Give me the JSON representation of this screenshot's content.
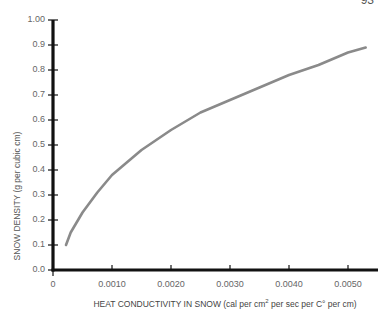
{
  "page": {
    "number": "93"
  },
  "chart_data": {
    "type": "line",
    "title": "",
    "xlabel": "HEAT CONDUCTIVITY IN SNOW (cal per cm² per sec per C° per cm)",
    "xlabel_parts": {
      "pre": "HEAT CONDUCTIVITY IN SNOW (cal per cm",
      "sup": "2",
      "post": " per sec  per C° per cm)"
    },
    "ylabel": "SNOW DENSITY (g per cubic cm)",
    "xlim": [
      0,
      0.0055
    ],
    "ylim": [
      0,
      1.0
    ],
    "x_ticks": [
      "0",
      "0.0010",
      "0.0020",
      "0.0030",
      "0.0040",
      "0.0050"
    ],
    "x_tick_values": [
      0,
      0.001,
      0.002,
      0.003,
      0.004,
      0.005
    ],
    "y_ticks": [
      "0.0",
      "0.1",
      "0.2",
      "0.3",
      "0.4",
      "0.5",
      "0.6",
      "0.7",
      "0.8",
      "0.9",
      "1.00"
    ],
    "y_tick_values": [
      0,
      0.1,
      0.2,
      0.3,
      0.4,
      0.5,
      0.6,
      0.7,
      0.8,
      0.9,
      1.0
    ],
    "grid": false,
    "legend": null,
    "series": [
      {
        "name": "Snow density vs heat conductivity",
        "color": "#8a8a8a",
        "x": [
          0.00022,
          0.0003,
          0.0005,
          0.00075,
          0.001,
          0.0015,
          0.002,
          0.0025,
          0.003,
          0.0035,
          0.004,
          0.0045,
          0.005,
          0.0053
        ],
        "y": [
          0.1,
          0.15,
          0.23,
          0.31,
          0.38,
          0.48,
          0.56,
          0.63,
          0.68,
          0.73,
          0.78,
          0.82,
          0.87,
          0.89
        ]
      }
    ]
  },
  "colors": {
    "axis": "#111111",
    "curve": "#8a8a8a",
    "text": "#666666"
  }
}
